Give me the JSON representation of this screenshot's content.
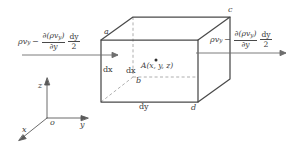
{
  "figure": {
    "kind": "fluid-mechanics-control-volume-diagram"
  },
  "flux_labels": {
    "left": {
      "name": "inflow-flux-expression",
      "base_symbol": "ρv",
      "base_subscript": "y",
      "operator": "−",
      "derivative_numerator": "∂(ρv",
      "derivative_numerator_sub": "y",
      "derivative_numerator_close": ")",
      "derivative_denominator": "∂y",
      "factor_numerator": "dy",
      "factor_denominator": "2",
      "plain": "ρv_y − ∂(ρv_y)/∂y · dy/2"
    },
    "right": {
      "name": "outflow-flux-expression",
      "base_symbol": "ρv",
      "base_subscript": "y",
      "operator": "−",
      "derivative_numerator": "∂(ρv",
      "derivative_numerator_sub": "y",
      "derivative_numerator_close": ")",
      "derivative_denominator": "∂y",
      "factor_numerator": "dy",
      "factor_denominator": "2",
      "plain": "ρv_y − ∂(ρv_y)/∂y · dy/2"
    }
  },
  "vertices": {
    "a": "a",
    "b": "b",
    "c": "c",
    "d": "d"
  },
  "point": {
    "label": "A(x, y, z)",
    "marker": "dot-marker"
  },
  "dimensions": {
    "dx_left": "dx",
    "dx_inner": "dx",
    "dy_bottom": "dy"
  },
  "axes": {
    "origin": "o",
    "x": "x",
    "y": "y",
    "z": "z"
  },
  "colors": {
    "stroke": "#4a4a4a",
    "hidden_stroke": "#8e8e8e",
    "text": "#3d3d3d",
    "background": "#ffffff"
  }
}
